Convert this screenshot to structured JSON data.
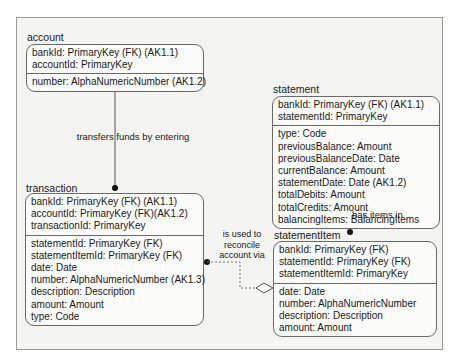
{
  "entities": {
    "account": {
      "title": "account",
      "keys": [
        "bankId: PrimaryKey (FK) (AK1.1)",
        "accountId: PrimaryKey"
      ],
      "attributes": [
        "number: AlphaNumericNumber (AK1.2)"
      ]
    },
    "statement": {
      "title": "statement",
      "keys": [
        "bankId: PrimaryKey (FK) (AK1.1)",
        "statementId: PrimaryKey"
      ],
      "attributes": [
        "type: Code",
        "previousBalance: Amount",
        "previousBalanceDate: Date",
        "currentBalance: Amount",
        "statementDate: Date (AK1.2)",
        "totalDebits: Amount",
        "totalCredits: Amount",
        "balancingItems: BalancingItems"
      ]
    },
    "transaction": {
      "title": "transaction",
      "keys": [
        "bankId: PrimaryKey (FK) (AK1.1)",
        "accountId: PrimaryKey (FK)(AK1.2)",
        "transactionId: PrimaryKey"
      ],
      "attributes": [
        "statementId: PrimaryKey (FK)",
        "statementItemId: PrimaryKey (FK)",
        "date: Date",
        "number: AlphaNumericNumber (AK1.3)",
        "description: Description",
        "amount: Amount",
        "type: Code"
      ]
    },
    "statementItem": {
      "title": "statementItem",
      "keys": [
        "bankId: PrimaryKey (FK)",
        "statementId: PrimaryKey (FK)",
        "statementItemId: PrimaryKey"
      ],
      "attributes": [
        "date: Date",
        "number: AlphaNumericNumber",
        "description: Description",
        "amount: Amount"
      ]
    }
  },
  "relationships": {
    "account_transaction": "transfers funds by entering",
    "statement_statementItem": "has items in",
    "transaction_statementItem": [
      "is used to",
      "reconcile",
      "account via"
    ]
  }
}
